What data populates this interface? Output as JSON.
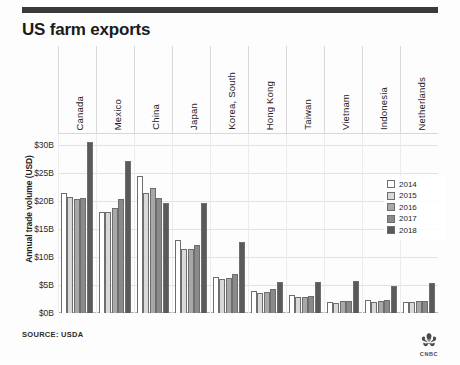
{
  "header": {
    "title": "US farm exports",
    "rule_color": "#3a3a3a"
  },
  "footer": {
    "source": "SOURCE: USDA",
    "logo_name": "cnbc-peacock-logo",
    "logo_text": "CNBC"
  },
  "legend": {
    "position": "right-middle",
    "entries": [
      {
        "label": "2014",
        "color": "#ffffff"
      },
      {
        "label": "2015",
        "color": "#d9d9d9"
      },
      {
        "label": "2016",
        "color": "#a8a8a8"
      },
      {
        "label": "2017",
        "color": "#8a8a8a"
      },
      {
        "label": "2018",
        "color": "#5a5a5a"
      }
    ]
  },
  "chart_data": {
    "type": "bar",
    "title": "US farm exports",
    "xlabel": "",
    "ylabel": "Annual trade volume (USD)",
    "ylim": [
      0,
      32
    ],
    "yticks": [
      "$0B",
      "$5B",
      "$10B",
      "$15B",
      "$20B",
      "$25B",
      "$30B"
    ],
    "ytick_values": [
      0,
      5,
      10,
      15,
      20,
      25,
      30
    ],
    "grid": true,
    "legend_position": "right",
    "units": "billions of USD",
    "categories": [
      "Canada",
      "Mexico",
      "China",
      "Japan",
      "Korea, South",
      "Hong Kong",
      "Taiwan",
      "Vietnam",
      "Indonesia",
      "Netherlands"
    ],
    "series": [
      {
        "name": "2014",
        "color": "#ffffff",
        "values": [
          21.5,
          18.0,
          24.5,
          13.0,
          6.5,
          4.0,
          3.2,
          2.0,
          2.3,
          1.9
        ]
      },
      {
        "name": "2015",
        "color": "#d9d9d9",
        "values": [
          20.8,
          18.0,
          21.5,
          11.5,
          6.0,
          3.6,
          2.8,
          1.8,
          1.9,
          2.0
        ]
      },
      {
        "name": "2016",
        "color": "#a8a8a8",
        "values": [
          20.3,
          18.7,
          22.3,
          11.4,
          6.2,
          3.8,
          2.9,
          2.1,
          2.2,
          2.1
        ]
      },
      {
        "name": "2017",
        "color": "#8a8a8a",
        "values": [
          20.6,
          20.3,
          20.5,
          12.2,
          7.0,
          4.3,
          3.0,
          2.2,
          2.4,
          2.2
        ]
      },
      {
        "name": "2018",
        "color": "#5a5a5a",
        "values": [
          30.6,
          27.2,
          19.6,
          19.6,
          12.7,
          5.6,
          5.6,
          5.8,
          4.9,
          5.3
        ]
      }
    ]
  }
}
